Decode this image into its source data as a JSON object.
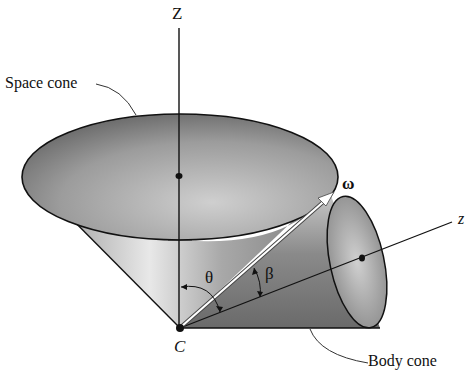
{
  "diagram": {
    "type": "torque-free precession cones",
    "labels": {
      "Z_axis": "Z",
      "z_axis": "z",
      "space_cone": "Space cone",
      "body_cone": "Body cone",
      "omega": "ω",
      "theta": "θ",
      "beta": "β",
      "point_C": "C"
    },
    "colors": {
      "line": "#111111",
      "cone_dark": "#5a5a5a",
      "cone_light": "#e6e6e6",
      "omega_arrow": "#ffffff"
    }
  }
}
